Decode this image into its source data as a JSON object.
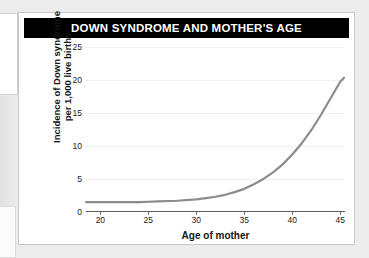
{
  "card": {
    "title": "DOWN SYNDROME AND MOTHER'S AGE"
  },
  "colors": {
    "title_bar_background": "#000000",
    "title_bar_text": "#ffffff",
    "curve": "#8c8c8c",
    "axis": "#5e5e60",
    "gridline": "#f0f0f1",
    "card_background": "#ffffff",
    "page_background": "#ececed"
  },
  "chart_data": {
    "type": "line",
    "title": "DOWN SYNDROME AND MOTHER'S AGE",
    "subtitle": "",
    "xlabel": "Age of mother",
    "ylabel": "Incidence of Down syndrome per 1,000 live births",
    "ylabel_lines": [
      "Incidence of Down syndrome",
      "per 1,000 live births"
    ],
    "xlim": [
      18.5,
      45.5
    ],
    "ylim": [
      0,
      26
    ],
    "xticks": [
      20,
      25,
      30,
      35,
      40,
      45
    ],
    "xtick_labels": [
      "20",
      "25",
      "30",
      "35",
      "40",
      "45"
    ],
    "yticks": [
      0,
      5,
      10,
      15,
      20,
      25
    ],
    "ytick_labels": [
      "0",
      "5",
      "10",
      "15",
      "20",
      "25"
    ],
    "grid": true,
    "grid_axis": "y",
    "legend": false,
    "legend_position": "none",
    "series": [
      {
        "name": "Incidence of Down syndrome",
        "color": "#8c8c8c",
        "line_width": 2.2,
        "x": [
          18.5,
          20,
          22,
          24,
          25,
          26,
          28,
          30,
          31,
          32,
          33,
          34,
          35,
          36,
          37,
          38,
          39,
          40,
          41,
          42,
          43,
          44,
          45,
          45.4
        ],
        "values": [
          1.5,
          1.5,
          1.5,
          1.5,
          1.55,
          1.6,
          1.7,
          1.9,
          2.1,
          2.3,
          2.6,
          3.0,
          3.5,
          4.2,
          5.0,
          6.0,
          7.2,
          8.7,
          10.4,
          12.4,
          14.7,
          17.2,
          19.7,
          20.3
        ]
      }
    ],
    "annotations": []
  }
}
